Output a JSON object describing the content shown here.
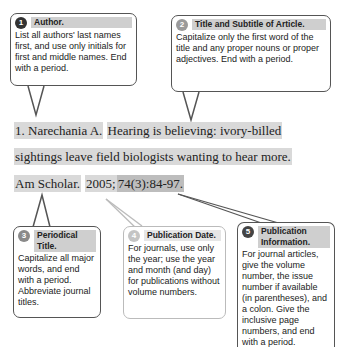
{
  "callouts": [
    {
      "number": "1",
      "title": "Author.",
      "text": "List all authors' last names first, and use only initials for first and middle names. End with a period.",
      "badge_color": "#333333"
    },
    {
      "number": "2",
      "title": "Title and Subtitle of Article.",
      "text": "Capitalize only the first word of the title and any proper nouns or proper adjectives. End with a period.",
      "badge_color": "#9a9a9a"
    },
    {
      "number": "3",
      "title": "Periodical Title.",
      "text": "Capitalize all major words, and end with a period. Abbreviate journal titles.",
      "badge_color": "#8a8a8a"
    },
    {
      "number": "4",
      "title": "Publication Date.",
      "text": "For journals, use only the year; use the year and month (and day) for publications without volume numbers.",
      "badge_color": "#c4c4c4"
    },
    {
      "number": "5",
      "title": "Publication Information.",
      "text": "For journal articles, give the volume number, the issue number if available (in parentheses), and a colon. Give the inclusive page numbers, and end with a period.",
      "badge_color": "#444444"
    }
  ],
  "citation": {
    "author": "1. Narechania A.",
    "title_line1": "Hearing is believing: ivory-billed",
    "title_line2": "sightings leave field biologists wanting to hear more.",
    "periodical": "Am Scholar.",
    "date": "2005;",
    "pub_info": "74(3):84-97."
  }
}
